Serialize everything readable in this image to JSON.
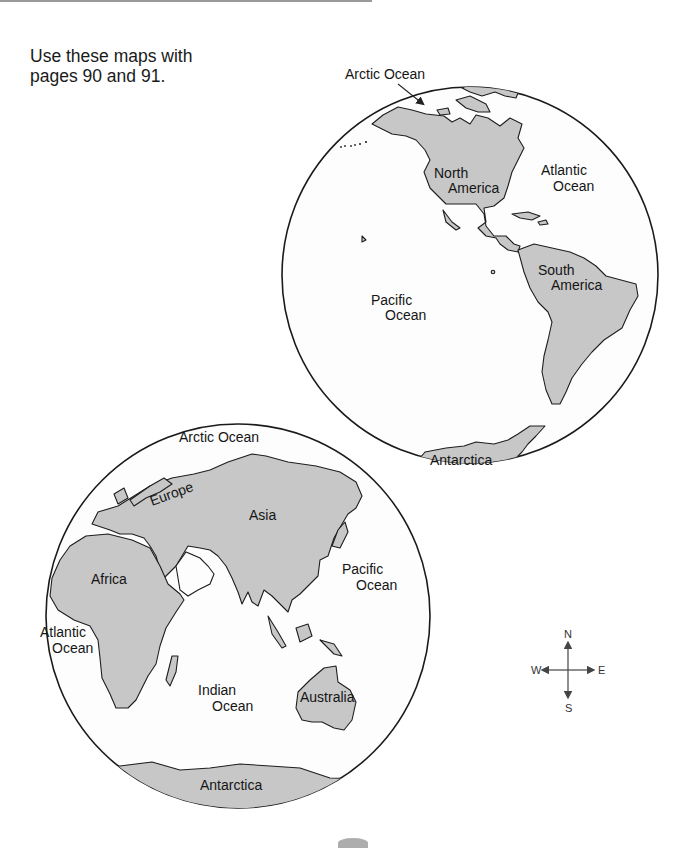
{
  "instructions": {
    "line1": "Use these maps with",
    "line2": "pages 90 and 91."
  },
  "western_hemisphere": {
    "labels": {
      "arctic_ocean": "Arctic Ocean",
      "north_america_1": "North",
      "north_america_2": "America",
      "atlantic_1": "Atlantic",
      "atlantic_2": "Ocean",
      "south_america_1": "South",
      "south_america_2": "America",
      "pacific_1": "Pacific",
      "pacific_2": "Ocean",
      "antarctica": "Antarctica"
    }
  },
  "eastern_hemisphere": {
    "labels": {
      "arctic_ocean": "Arctic Ocean",
      "europe": "Europe",
      "asia": "Asia",
      "africa": "Africa",
      "pacific_1": "Pacific",
      "pacific_2": "Ocean",
      "atlantic_1": "Atlantic",
      "atlantic_2": "Ocean",
      "indian_1": "Indian",
      "indian_2": "Ocean",
      "australia": "Australia",
      "antarctica": "Antarctica"
    }
  },
  "compass": {
    "n": "N",
    "s": "S",
    "e": "E",
    "w": "W"
  },
  "colors": {
    "land": "#c7c7c7",
    "outline": "#1a1a1a",
    "paper": "#ffffff"
  }
}
